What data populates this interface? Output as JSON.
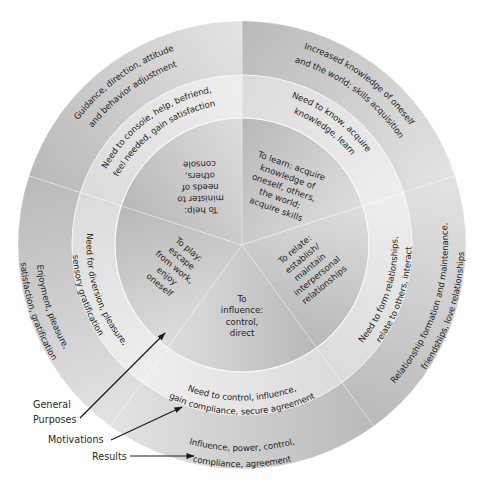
{
  "diagram": {
    "center": [
      242,
      245
    ],
    "radii": {
      "inner": 127,
      "middle": 170,
      "outer": 224
    },
    "start_angle_deg": 0,
    "segment_span_deg": 72,
    "colors": {
      "inner_dark": "#a9a9a9",
      "inner_light": "#ececec",
      "middle_light": "#f2f2f2",
      "middle_dark": "#d7d7d7",
      "outer_light": "#e3e3e3",
      "outer_dark": "#b9b9b9",
      "text": "#1f1f1f",
      "arrow": "#1a1a1a"
    },
    "segments": [
      {
        "name": "learn",
        "general_purpose": [
          "To learn: acquire",
          "knowledge of",
          "oneself, others,",
          "the world;",
          "acquire skills"
        ],
        "motivation": [
          "Need to know, acquire",
          "knowledge, learn"
        ],
        "result": [
          "Increased knowledge of oneself",
          "and the world; skills acquisition"
        ]
      },
      {
        "name": "relate",
        "general_purpose": [
          "To relate:",
          "establish/",
          "maintain",
          "interpersonal",
          "relationships"
        ],
        "motivation": [
          "Need to form relationships,",
          "relate to others, interact"
        ],
        "result": [
          "Relationship formation and maintenance,",
          "friendships, love relationships"
        ]
      },
      {
        "name": "influence",
        "general_purpose": [
          "To",
          "influence:",
          "control,",
          "direct"
        ],
        "motivation": [
          "Need to control, influence,",
          "gain compliance, secure agreement"
        ],
        "result": [
          "Influence, power, control,",
          "compliance, agreement"
        ]
      },
      {
        "name": "play",
        "general_purpose": [
          "To play:",
          "escape",
          "from work,",
          "enjoy",
          "oneself"
        ],
        "motivation": [
          "Need for diversion, pleasure,",
          "sensory gratification"
        ],
        "result": [
          "Enjoyment, pleasure,",
          "satisfaction, gratification"
        ]
      },
      {
        "name": "help",
        "general_purpose": [
          "To help:",
          "minister to",
          "needs of",
          "others,",
          "console"
        ],
        "motivation": [
          "Need to console, help, befriend,",
          "feel needed, gain satisfaction"
        ],
        "result": [
          "Guidance, direction, attitude",
          "and behavior adjustment"
        ]
      }
    ]
  },
  "callouts": [
    {
      "name": "general-purposes",
      "lines": [
        "General",
        "Purposes"
      ],
      "label_pos": [
        33,
        397
      ],
      "arrow_from": [
        80,
        418
      ],
      "arrow_to": [
        165,
        333
      ]
    },
    {
      "name": "motivations",
      "lines": [
        "Motivations"
      ],
      "label_pos": [
        48,
        432
      ],
      "arrow_from": [
        111,
        440
      ],
      "arrow_to": [
        182,
        407
      ]
    },
    {
      "name": "results",
      "lines": [
        "Results"
      ],
      "label_pos": [
        92,
        449
      ],
      "arrow_from": [
        130,
        456
      ],
      "arrow_to": [
        194,
        456
      ]
    }
  ]
}
